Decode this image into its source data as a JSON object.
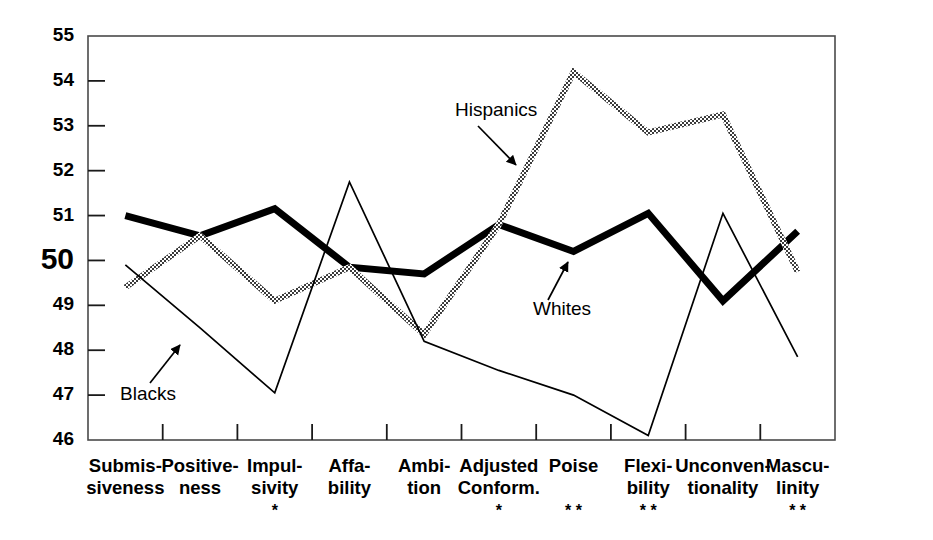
{
  "chart_data": {
    "type": "line",
    "title": "",
    "subtitle": "",
    "xlabel": "",
    "ylabel": "",
    "ylim": [
      46,
      55
    ],
    "yticks": [
      46,
      47,
      48,
      49,
      50,
      51,
      52,
      53,
      54,
      55
    ],
    "ytick_labels": [
      "46",
      "47",
      "48",
      "49",
      "50",
      "51",
      "52",
      "53",
      "54",
      "55"
    ],
    "emphasized_ytick": "50",
    "grid": false,
    "legend_position": "inline-annotations",
    "categories": [
      "Submis-\nsiveness",
      "Positive-\nness",
      "Impul-\nsivity",
      "Affa-\nbility",
      "Ambi-\ntion",
      "Adjusted\nConform.",
      "Poise",
      "Flexi-\nbility",
      "Unconven-\ntionality",
      "Mascu-\nlinity"
    ],
    "category_lines": [
      [
        "Submis-",
        "siveness"
      ],
      [
        "Positive-",
        "ness"
      ],
      [
        "Impul-",
        "sivity"
      ],
      [
        "Affa-",
        "bility"
      ],
      [
        "Ambi-",
        "tion"
      ],
      [
        "Adjusted",
        "Conform."
      ],
      [
        "Poise",
        ""
      ],
      [
        "Flexi-",
        "bility"
      ],
      [
        "Unconven-",
        "tionality"
      ],
      [
        "Mascu-",
        "linity"
      ]
    ],
    "significance": [
      "",
      "",
      "*",
      "",
      "",
      "*",
      "* *",
      "* *",
      "",
      "* *"
    ],
    "series": [
      {
        "name": "Whites",
        "style": "thick-solid-black",
        "color": "#000000",
        "stroke_width": 7,
        "values": [
          51.0,
          50.55,
          51.15,
          49.85,
          49.7,
          50.8,
          50.2,
          51.05,
          49.1,
          50.65
        ]
      },
      {
        "name": "Hispanics",
        "style": "thick-hatched-gray",
        "color": "#555555",
        "stroke_width": 6,
        "values": [
          49.4,
          50.55,
          49.1,
          49.85,
          48.35,
          50.8,
          54.2,
          52.85,
          53.25,
          49.75
        ]
      },
      {
        "name": "Blacks",
        "style": "thin-solid-black",
        "color": "#000000",
        "stroke_width": 1.7,
        "values": [
          49.9,
          48.5,
          47.05,
          51.75,
          48.2,
          47.55,
          47.0,
          46.1,
          51.05,
          47.85
        ]
      }
    ],
    "annotations": [
      {
        "text": "Hispanics",
        "label_x": 455,
        "label_y": 116,
        "arrow_from_x": 478,
        "arrow_from_y": 126,
        "arrow_to_x": 516,
        "arrow_to_y": 165
      },
      {
        "text": "Whites",
        "label_x": 533,
        "label_y": 315,
        "arrow_from_x": 548,
        "arrow_from_y": 300,
        "arrow_to_x": 568,
        "arrow_to_y": 262
      },
      {
        "text": "Blacks",
        "label_x": 120,
        "label_y": 400,
        "arrow_from_x": 150,
        "arrow_from_y": 383,
        "arrow_to_x": 180,
        "arrow_to_y": 345
      }
    ]
  },
  "plot_geometry": {
    "left": 88,
    "right": 835,
    "top": 36,
    "bottom": 440
  }
}
